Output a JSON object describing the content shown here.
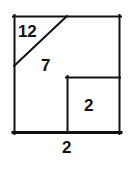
{
  "figure": {
    "type": "geometry-diagram",
    "stroke_color": "#111111",
    "background_color": "#ffffff",
    "outer_square": {
      "name": "outer-square",
      "left": 14,
      "top": 16,
      "right": 120,
      "bottom": 133,
      "stroke_width": 2
    },
    "diagonal": {
      "name": "corner-diagonal",
      "x1": 14,
      "y1": 66,
      "x2": 67,
      "y2": 16,
      "stroke_width": 2
    },
    "inner_square": {
      "name": "inner-square",
      "left": 67,
      "top": 77,
      "right": 120,
      "bottom": 133,
      "stroke_width": 2
    },
    "labels": {
      "hypotenuse": "12",
      "leg": "7",
      "inner_square": "2",
      "base": "2"
    }
  }
}
